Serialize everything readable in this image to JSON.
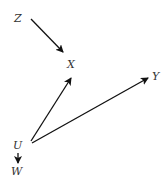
{
  "diagram": {
    "type": "directed-graph",
    "nodes": [
      {
        "id": "Z",
        "label": "Z",
        "x": 18,
        "y": 22
      },
      {
        "id": "X",
        "label": "X",
        "x": 71,
        "y": 68
      },
      {
        "id": "Y",
        "label": "Y",
        "x": 155,
        "y": 80
      },
      {
        "id": "U",
        "label": "U",
        "x": 18,
        "y": 148
      },
      {
        "id": "W",
        "label": "W",
        "x": 17,
        "y": 174
      }
    ],
    "edges": [
      {
        "from": "Z",
        "to": "X"
      },
      {
        "from": "U",
        "to": "X"
      },
      {
        "from": "U",
        "to": "Y"
      },
      {
        "from": "U",
        "to": "W"
      }
    ],
    "colors": {
      "edge": "#111111",
      "label": "#333333",
      "background": "#ffffff"
    }
  }
}
